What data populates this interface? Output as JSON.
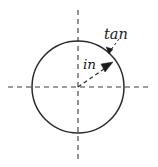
{
  "figure": {
    "type": "geometry-diagram",
    "background_color": "#ffffff",
    "stroke_color": "#2b2b2b",
    "axis_color": "#3a3a3a",
    "canvas": {
      "width": 158,
      "height": 167
    },
    "circle": {
      "name": "boundary-circle",
      "center_x": 78,
      "center_y": 87,
      "radius": 46
    },
    "axes": {
      "horizontal": {
        "x1": 8,
        "y1": 87,
        "x2": 150,
        "y2": 87
      },
      "vertical": {
        "x1": 78,
        "y1": 10,
        "x2": 78,
        "y2": 160
      }
    },
    "vectors": [
      {
        "name": "in-vector",
        "label": "in",
        "from_x": 78,
        "from_y": 87,
        "to_x": 112,
        "to_y": 63,
        "label_x": 84,
        "label_y": 68,
        "style": "dashed-with-arrowhead"
      }
    ],
    "leaders": [
      {
        "name": "tan-leader",
        "label": "tan",
        "from_x": 117,
        "from_y": 40,
        "to_x": 108,
        "to_y": 52,
        "label_x": 104,
        "label_y": 38,
        "style": "dotted-with-arrowhead"
      }
    ],
    "labels": {
      "tangential": "tan",
      "incident": "in"
    }
  }
}
